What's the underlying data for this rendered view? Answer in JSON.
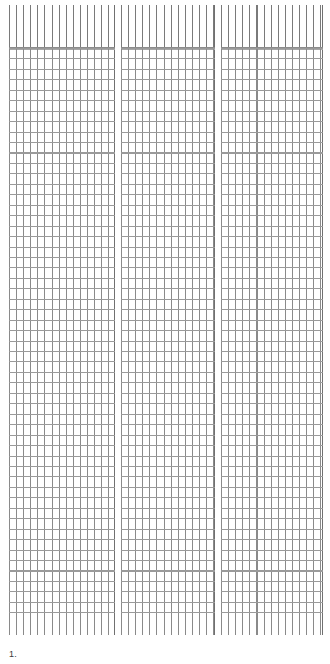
{
  "document": {
    "type": "tabular-report-page",
    "background_color": "#ffffff",
    "rule_color": "#8a8a8a",
    "heavy_rule_color": "#707070",
    "text_color": "#3a3a3a",
    "page_width": 330,
    "page_height": 664
  },
  "footer": {
    "page_number": "1."
  },
  "table": {
    "panel_count": 3,
    "header_rows": 1,
    "header_band_height": 43,
    "body_row_count": 54,
    "row_height": 10.45,
    "column_width": 7.1,
    "cells_are_blank": true,
    "panels": [
      {
        "name": "left-panel",
        "columns": 15,
        "header_labels": [
          "",
          "",
          "",
          "",
          "",
          "",
          "",
          "",
          "",
          "",
          "",
          "",
          "",
          "",
          ""
        ],
        "rows": []
      },
      {
        "name": "middle-panel",
        "columns": 13,
        "header_labels": [
          "",
          "",
          "",
          "",
          "",
          "",
          "",
          "",
          "",
          "",
          "",
          "",
          ""
        ],
        "rows": []
      },
      {
        "name": "right-panel",
        "columns": 14,
        "header_labels": [
          "",
          "",
          "",
          "",
          "",
          "",
          "",
          "",
          "",
          "",
          "",
          "",
          "",
          ""
        ],
        "rows": []
      }
    ]
  },
  "chart_data": {
    "type": "table",
    "title": "",
    "subtitle": "",
    "xlabel": "",
    "ylabel": "",
    "grid": true,
    "legend": "none",
    "annotations": [
      "1."
    ],
    "columns": [],
    "rows": [],
    "note": "Blank ruled grid: three side-by-side column blocks of empty cells with a taller header band; no printed values."
  }
}
